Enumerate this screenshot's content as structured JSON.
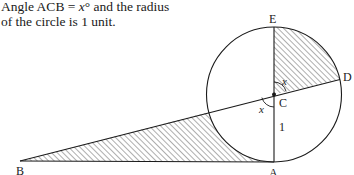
{
  "caption": {
    "line1_prefix": "Angle ACB = ",
    "line1_var": "x",
    "line1_suffix": "° and the radius",
    "line2": "of the circle is 1 unit."
  },
  "diagram": {
    "labels": {
      "E": "E",
      "D": "D",
      "C": "C",
      "A": "A",
      "B": "B",
      "angle_upper": "x",
      "angle_lower": "x",
      "radius": "1"
    },
    "geometry": {
      "center": [
        274,
        94.5
      ],
      "radius": 67.5,
      "point_E": [
        274,
        27
      ],
      "point_A": [
        274,
        162
      ],
      "point_D": [
        340,
        79.5
      ],
      "point_B": [
        20,
        161
      ],
      "shaded_regions": [
        "sector ECD",
        "region between tangent BA, line BC and arc"
      ]
    },
    "colors": {
      "stroke": "#1a1a1a",
      "hatch": "#333333",
      "background": "#ffffff"
    }
  }
}
